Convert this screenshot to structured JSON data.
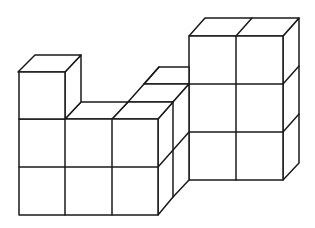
{
  "diagram": {
    "title": "",
    "stroke_color": "#1a1a1a",
    "background": "#ffffff",
    "structure": {
      "left_tower": {
        "columns": 1,
        "height": 3
      },
      "left_base": {
        "columns": 2,
        "height": 2
      },
      "middle_block": {
        "columns": 1,
        "height": 2,
        "depth": 2,
        "step_visible_behind": true
      },
      "right_tower": {
        "columns": 2,
        "height": 3
      }
    }
  }
}
